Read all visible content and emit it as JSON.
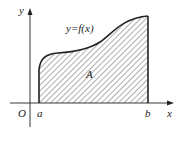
{
  "diagram": {
    "title": "",
    "curve_label": "y=f(x)",
    "region_label": "A",
    "origin_label": "O",
    "x_axis_label": "x",
    "y_axis_label": "y",
    "lower_bound_label": "a",
    "upper_bound_label": "b",
    "colors": {
      "stroke": "#222222",
      "hatch": "#333333",
      "background": "#ffffff"
    }
  }
}
